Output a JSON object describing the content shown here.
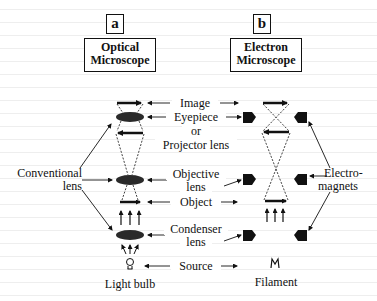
{
  "panels": {
    "a": {
      "letter": "a",
      "title_line1": "Optical",
      "title_line2": "Microscope"
    },
    "b": {
      "letter": "b",
      "title_line1": "Electron",
      "title_line2": "Microscope"
    }
  },
  "center_labels": {
    "image": "Image",
    "eyepiece_line1": "Eyepiece",
    "eyepiece_line2": "or",
    "eyepiece_line3": "Projector lens",
    "objective_line1": "Objective",
    "objective_line2": "lens",
    "object": "Object",
    "condenser_line1": "Condenser",
    "condenser_line2": "lens",
    "source": "Source"
  },
  "side_labels": {
    "conventional_line1": "Conventional",
    "conventional_line2": "lens",
    "electromagnets_line1": "Electro-",
    "electromagnets_line2": "magnets",
    "light_bulb": "Light bulb",
    "filament": "Filament"
  },
  "icons": {
    "light_source_optical": "light-bulb-icon",
    "light_source_electron": "filament-icon"
  },
  "colors": {
    "ink": "#111111",
    "lens_fill": "#2a2a2a",
    "background": "#ffffff"
  }
}
